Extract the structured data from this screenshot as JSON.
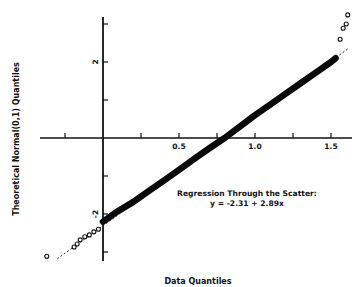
{
  "chart_data": {
    "type": "scatter",
    "title": "",
    "xlabel": "Data Quantiles",
    "ylabel": "Theoretical Normal(0,1) Quantiles",
    "xlim": [
      -0.41,
      1.63
    ],
    "ylim": [
      -3.2,
      3.2
    ],
    "x_ticks": [
      -0.25,
      0,
      0.25,
      0.5,
      0.75,
      1.0,
      1.25,
      1.5
    ],
    "x_tick_labels": [
      {
        "value": 0.5,
        "label": "0.5"
      },
      {
        "value": 1.0,
        "label": "1.0"
      },
      {
        "value": 1.5,
        "label": "1.5"
      }
    ],
    "y_ticks": [
      -3,
      -2,
      -1,
      0,
      1,
      2,
      3
    ],
    "y_tick_labels": [
      {
        "value": 2,
        "label": "2"
      },
      {
        "value": -2,
        "label": "-2"
      }
    ],
    "grid": false,
    "legend": null,
    "annotation": {
      "line1": "Regression Through the Scatter:",
      "line2": "y = -2.31 + 2.89x"
    },
    "regression": {
      "intercept": -2.31,
      "slope": 2.89,
      "x_range": [
        -0.3,
        1.62
      ],
      "style": "dashed"
    },
    "band": {
      "description": "dense Q-Q point band following the regression line",
      "x": [
        0.0,
        0.1,
        0.2,
        0.3,
        0.4,
        0.5,
        0.6,
        0.7,
        0.8,
        0.9,
        1.0,
        1.1,
        1.2,
        1.3,
        1.4,
        1.5,
        1.53
      ],
      "y": [
        -2.2,
        -1.92,
        -1.68,
        -1.4,
        -1.12,
        -0.84,
        -0.55,
        -0.27,
        0.0,
        0.3,
        0.6,
        0.88,
        1.16,
        1.44,
        1.72,
        2.0,
        2.1
      ]
    },
    "outliers": [
      {
        "x": -0.37,
        "y": -3.11
      },
      {
        "x": -0.19,
        "y": -2.87
      },
      {
        "x": -0.17,
        "y": -2.79
      },
      {
        "x": -0.15,
        "y": -2.68
      },
      {
        "x": -0.12,
        "y": -2.6
      },
      {
        "x": -0.09,
        "y": -2.55
      },
      {
        "x": -0.06,
        "y": -2.47
      },
      {
        "x": -0.03,
        "y": -2.4
      },
      {
        "x": 1.56,
        "y": 2.6
      },
      {
        "x": 1.58,
        "y": 2.89
      },
      {
        "x": 1.6,
        "y": 3.0
      },
      {
        "x": 1.61,
        "y": 3.24
      }
    ]
  }
}
